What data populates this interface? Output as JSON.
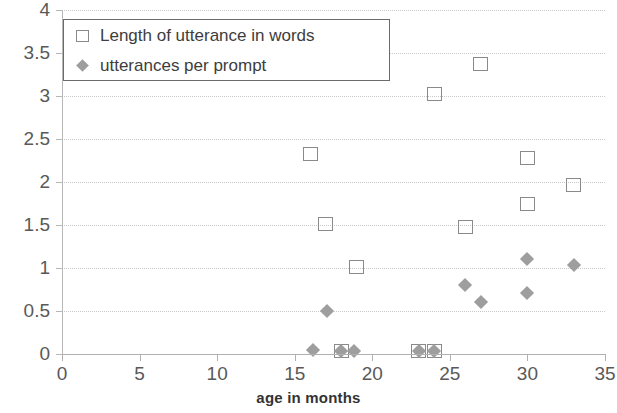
{
  "chart_data": {
    "type": "scatter",
    "title": "",
    "xlabel": "age in months",
    "ylabel": "",
    "xlim": [
      0,
      35
    ],
    "ylim": [
      0,
      4
    ],
    "xticks": [
      "0",
      "5",
      "10",
      "15",
      "20",
      "25",
      "30",
      "35"
    ],
    "yticks": [
      "0",
      "0.5",
      "1",
      "1.5",
      "2",
      "2.5",
      "3",
      "3.5",
      "4"
    ],
    "xtick_values": [
      0,
      5,
      10,
      15,
      20,
      25,
      30,
      35
    ],
    "ytick_values": [
      0,
      0.5,
      1,
      1.5,
      2,
      2.5,
      3,
      3.5,
      4
    ],
    "grid": "horizontal",
    "legend_position": "top-left",
    "series": [
      {
        "name": "Length of utterance in words",
        "marker": "open-square",
        "color": "#8a8a8a",
        "points": [
          {
            "x": 16,
            "y": 2.33
          },
          {
            "x": 17,
            "y": 1.51
          },
          {
            "x": 18,
            "y": 0.03
          },
          {
            "x": 19,
            "y": 1.01
          },
          {
            "x": 23,
            "y": 0.03
          },
          {
            "x": 24,
            "y": 0.03
          },
          {
            "x": 24,
            "y": 3.02
          },
          {
            "x": 26,
            "y": 1.48
          },
          {
            "x": 27,
            "y": 3.37
          },
          {
            "x": 30,
            "y": 2.28
          },
          {
            "x": 30,
            "y": 1.75
          },
          {
            "x": 33,
            "y": 1.97
          }
        ]
      },
      {
        "name": "utterances per prompt",
        "marker": "filled-diamond",
        "color": "#9e9e9e",
        "points": [
          {
            "x": 16.2,
            "y": 0.05
          },
          {
            "x": 17.1,
            "y": 0.5
          },
          {
            "x": 18,
            "y": 0.03
          },
          {
            "x": 18.8,
            "y": 0.03
          },
          {
            "x": 23,
            "y": 0.03
          },
          {
            "x": 24,
            "y": 0.03
          },
          {
            "x": 26,
            "y": 0.8
          },
          {
            "x": 27,
            "y": 0.6
          },
          {
            "x": 30,
            "y": 1.1
          },
          {
            "x": 30,
            "y": 0.71
          },
          {
            "x": 33,
            "y": 1.03
          }
        ]
      }
    ]
  },
  "legend": {
    "entries": [
      {
        "label": "Length of utterance in words",
        "marker": "open-square"
      },
      {
        "label": "utterances per prompt",
        "marker": "filled-diamond"
      }
    ]
  },
  "axis": {
    "x_title": "age in months"
  }
}
